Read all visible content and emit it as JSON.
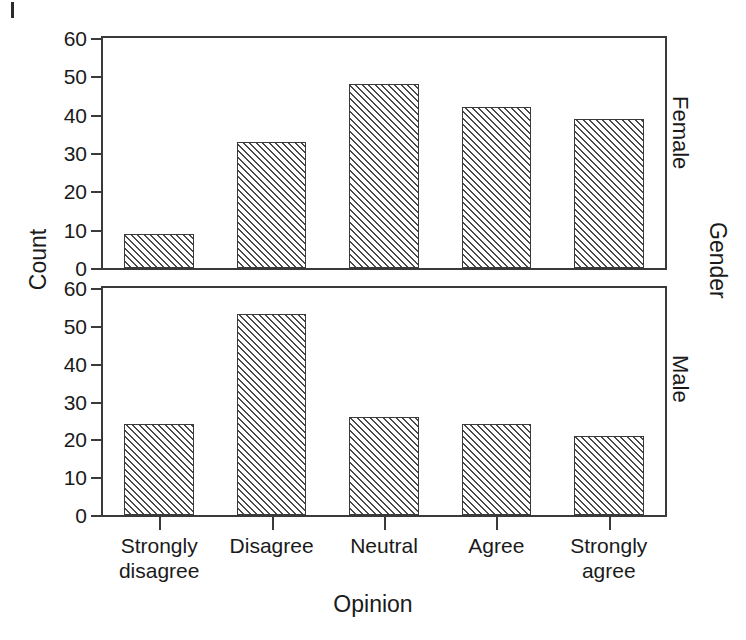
{
  "chart_data": {
    "type": "bar",
    "title": "",
    "xlabel": "Opinion",
    "ylabel": "Count",
    "panel_variable": "Gender",
    "categories": [
      "Strongly disagree",
      "Disagree",
      "Neutral",
      "Agree",
      "Strongly agree"
    ],
    "series": [
      {
        "name": "Female",
        "values": [
          9,
          33,
          48,
          42,
          39
        ]
      },
      {
        "name": "Male",
        "values": [
          24,
          53,
          26,
          24,
          21
        ]
      }
    ],
    "ylim": [
      0,
      60
    ],
    "yticks": [
      0,
      10,
      20,
      30,
      40,
      50,
      60
    ],
    "ytick_labels": [
      "0",
      "10",
      "20",
      "30",
      "40",
      "50",
      "60"
    ],
    "grid": false,
    "legend": "none",
    "bar_fill": "diagonal-hatch",
    "colors": {
      "line": "#3a3a3a",
      "hatch": "#4a4a4a",
      "background": "#ffffff",
      "text": "#1a1a1a"
    }
  },
  "axes": {
    "x_title": "Opinion",
    "y_title": "Count",
    "strip_title": "Gender"
  },
  "panels": [
    {
      "id": "female",
      "strip_label": "Female",
      "ytick_labels": [
        "0",
        "10",
        "20",
        "30",
        "40",
        "50",
        "60"
      ]
    },
    {
      "id": "male",
      "strip_label": "Male",
      "ytick_labels": [
        "0",
        "10",
        "20",
        "30",
        "40",
        "50",
        "60"
      ]
    }
  ],
  "x_tick_labels": [
    [
      "Strongly",
      "disagree"
    ],
    [
      "Disagree",
      ""
    ],
    [
      "Neutral",
      ""
    ],
    [
      "Agree",
      ""
    ],
    [
      "Strongly",
      "agree"
    ]
  ]
}
